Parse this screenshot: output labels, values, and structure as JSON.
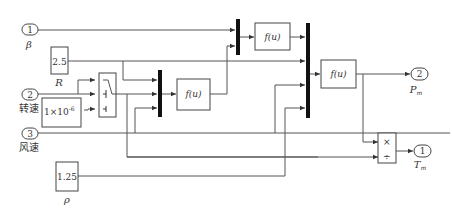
{
  "diagram": {
    "type": "simulink_block_diagram",
    "inports": [
      {
        "number": "1",
        "label": "β"
      },
      {
        "number": "2",
        "label": "转速"
      },
      {
        "number": "3",
        "label": "风速"
      }
    ],
    "outports": [
      {
        "number": "2",
        "label": "P",
        "sub": "m"
      },
      {
        "number": "1",
        "label": "T",
        "sub": "m"
      }
    ],
    "constants": [
      {
        "value": "2.5",
        "label": "R"
      },
      {
        "value": "1×10",
        "exp": "-6",
        "label": ""
      },
      {
        "value": "1.25",
        "label": "ρ"
      }
    ],
    "fcn_blocks": [
      {
        "expr": "f(u)"
      },
      {
        "expr": "f(u)"
      },
      {
        "expr": "f(u)"
      }
    ],
    "product_block": {
      "ops": [
        "×",
        "÷"
      ]
    },
    "switch_block": {
      "name": "switch"
    },
    "mux_count": 3
  }
}
